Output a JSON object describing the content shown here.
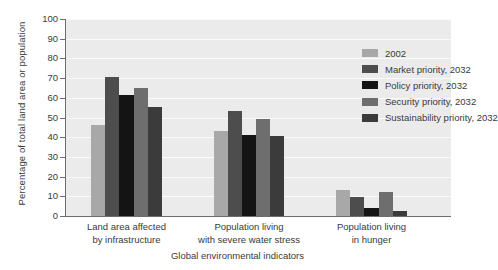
{
  "chart_data": {
    "type": "bar",
    "title": "",
    "xlabel": "Global environmental indicators",
    "ylabel": "Percentage of total land area or population",
    "ylim": [
      0,
      100
    ],
    "ytick_step": 10,
    "yticks": [
      "100",
      "90",
      "80",
      "70",
      "60",
      "50",
      "40",
      "30",
      "20",
      "10",
      "0"
    ],
    "grid": true,
    "legend_position": "top-right inside plot",
    "categories": [
      "Land area affected by infrastructure",
      "Population living with severe water stress",
      "Population living in hunger"
    ],
    "category_lines": [
      [
        "Land area affected",
        "by infrastructure"
      ],
      [
        "Population living",
        "with severe water stress"
      ],
      [
        "Population living",
        "in hunger"
      ]
    ],
    "series": [
      {
        "name": "2002",
        "color": "#a8a8a8",
        "values": [
          46,
          43,
          13
        ]
      },
      {
        "name": "Market priority, 2032",
        "color": "#4d4d4d",
        "values": [
          70.5,
          53.5,
          9.5
        ]
      },
      {
        "name": "Policy priority, 2032",
        "color": "#141414",
        "values": [
          61.5,
          41,
          4
        ]
      },
      {
        "name": "Security priority, 2032",
        "color": "#6e6e6e",
        "values": [
          65,
          49.5,
          12
        ]
      },
      {
        "name": "Sustainability priority, 2032",
        "color": "#3b3b3b",
        "values": [
          55.5,
          40.5,
          2.5
        ]
      }
    ],
    "plot_background": "#ebebeb",
    "gridline_color": "#fbfbfb",
    "axis_color": "#6e6e6e",
    "text_color": "#3a3a3a"
  }
}
